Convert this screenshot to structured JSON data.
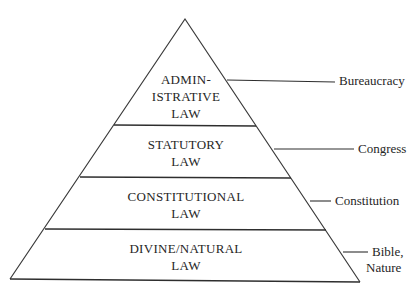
{
  "diagram": {
    "type": "pyramid",
    "direction": "bottom-to-top hierarchy",
    "colors": {
      "line": "#2e2e2e",
      "text": "#262626",
      "background": "#ffffff"
    },
    "tiers": [
      {
        "id": "administrative",
        "lines": [
          "ADMIN-",
          "ISTRATIVE",
          "LAW"
        ],
        "source": [
          "Bureaucracy"
        ]
      },
      {
        "id": "statutory",
        "lines": [
          "STATUTORY",
          "LAW"
        ],
        "source": [
          "Congress"
        ]
      },
      {
        "id": "constitutional",
        "lines": [
          "CONSTITUTIONAL",
          "LAW"
        ],
        "source": [
          "Constitution"
        ]
      },
      {
        "id": "divine-natural",
        "lines": [
          "DIVINE/NATURAL",
          "LAW"
        ],
        "source": [
          "Bible,",
          "Nature"
        ]
      }
    ]
  }
}
